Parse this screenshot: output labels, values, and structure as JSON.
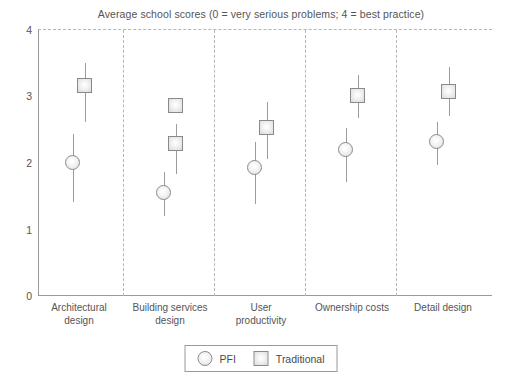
{
  "chart_data": {
    "type": "scatter",
    "title": "Average school scores (0 = very serious problems; 4 = best practice)",
    "xlabel": "",
    "ylabel": "",
    "ylim": [
      0,
      4
    ],
    "yticks": [
      "0",
      "1",
      "2",
      "3",
      "4"
    ],
    "grid": "top-dashed-line-only",
    "legend_position": "bottom-center",
    "categories": [
      "Architectural design",
      "Building services design",
      "User productivity",
      "Ownership costs",
      "Detail design"
    ],
    "category_lines": [
      [
        "Architectural",
        "design"
      ],
      [
        "Building services",
        "design"
      ],
      [
        "User",
        "productivity"
      ],
      [
        "Ownership costs",
        ""
      ],
      [
        "Detail design",
        ""
      ]
    ],
    "series": [
      {
        "name": "PFI",
        "marker": "circle",
        "values": [
          2.01,
          1.56,
          1.93,
          2.2,
          2.32
        ],
        "errors_low": [
          1.41,
          1.2,
          1.38,
          1.72,
          1.97
        ],
        "errors_high": [
          2.43,
          1.86,
          2.32,
          2.52,
          2.62
        ]
      },
      {
        "name": "Traditional",
        "marker": "square",
        "values": [
          3.17,
          2.3,
          2.53,
          3.02,
          3.07
        ],
        "errors_low": [
          2.62,
          1.83,
          2.06,
          2.67,
          2.7
        ],
        "errors_high": [
          3.51,
          2.58,
          2.92,
          3.32,
          3.45
        ]
      },
      {
        "name": "Traditional (upper point, Building services design only)",
        "marker": "square",
        "values": [
          null,
          2.87,
          null,
          null,
          null
        ],
        "errors_low": [
          null,
          2.87,
          null,
          null,
          null
        ],
        "errors_high": [
          null,
          2.87,
          null,
          null,
          null
        ]
      }
    ]
  },
  "legend": {
    "entries": [
      {
        "label": "PFI",
        "marker": "circle-marker-icon"
      },
      {
        "label": "Traditional",
        "marker": "square-marker-icon"
      }
    ]
  }
}
